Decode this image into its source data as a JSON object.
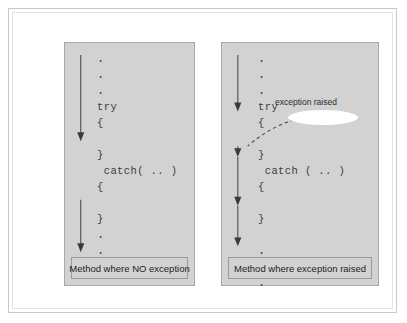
{
  "figure": {
    "colors": {
      "page_background": "#ffffff",
      "panel_fill": "#d2d2d2",
      "panel_border": "#a9a9a9",
      "frame_border": "#c9c9c9",
      "arrow": "#4a4a4a",
      "dashed_arrow": "#4a4a4a",
      "callout_fill": "#ffffff",
      "code_text": "#3c3c3c",
      "caption_text": "#232323"
    }
  },
  "panels": [
    {
      "id": "no-exception",
      "caption": "Method where NO exception",
      "code_lines": [
        {
          "text": ".",
          "kind": "dot"
        },
        {
          "text": ".",
          "kind": "dot"
        },
        {
          "text": ".",
          "kind": "dot"
        },
        {
          "text": "try",
          "kind": "code"
        },
        {
          "text": "{",
          "kind": "code"
        },
        {
          "text": "",
          "kind": "blank"
        },
        {
          "text": "}",
          "kind": "code"
        },
        {
          "text": " catch( .. )",
          "kind": "code"
        },
        {
          "text": "{",
          "kind": "code"
        },
        {
          "text": "",
          "kind": "blank"
        },
        {
          "text": "}",
          "kind": "code"
        },
        {
          "text": ".",
          "kind": "dot"
        },
        {
          "text": ".",
          "kind": "dot"
        },
        {
          "text": ".",
          "kind": "dot"
        }
      ]
    },
    {
      "id": "exception-raised",
      "caption": "Method where exception raised",
      "callout_label": "exception raised",
      "code_lines": [
        {
          "text": ".",
          "kind": "dot"
        },
        {
          "text": ".",
          "kind": "dot"
        },
        {
          "text": ".",
          "kind": "dot"
        },
        {
          "text": "try",
          "kind": "code"
        },
        {
          "text": "{",
          "kind": "code"
        },
        {
          "text": "",
          "kind": "blank"
        },
        {
          "text": "}",
          "kind": "code"
        },
        {
          "text": " catch ( .. )",
          "kind": "code"
        },
        {
          "text": "{",
          "kind": "code"
        },
        {
          "text": "",
          "kind": "blank"
        },
        {
          "text": "}",
          "kind": "code"
        },
        {
          "text": "",
          "kind": "blank"
        },
        {
          "text": ".",
          "kind": "dot"
        },
        {
          "text": ".",
          "kind": "dot"
        },
        {
          "text": ".",
          "kind": "dot"
        }
      ]
    }
  ]
}
